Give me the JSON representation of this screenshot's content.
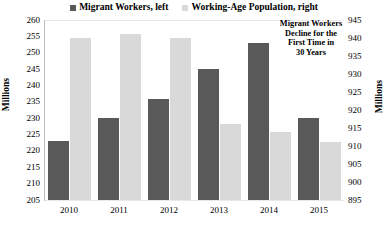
{
  "legend": {
    "items": [
      {
        "label": "Migrant Workers, left",
        "color": "#595959",
        "icon": "square-swatch-icon"
      },
      {
        "label": "Working-Age Population, right",
        "color": "#d9d9d9",
        "icon": "square-swatch-icon"
      }
    ]
  },
  "axes": {
    "left_title": "Millions",
    "right_title": "Millions",
    "left_ticks": [
      "260",
      "255",
      "250",
      "245",
      "240",
      "235",
      "230",
      "225",
      "220",
      "215",
      "210",
      "205"
    ],
    "right_ticks": [
      "945",
      "940",
      "935",
      "930",
      "925",
      "920",
      "915",
      "910",
      "905",
      "900",
      "895"
    ]
  },
  "annotation": {
    "line1": "Migrant Workers",
    "line2": "Decline for the",
    "line3": "First Time in",
    "line4": "30 Years"
  },
  "xlabels": [
    "2010",
    "2011",
    "2012",
    "2013",
    "2014",
    "2015"
  ],
  "chart_data": {
    "type": "bar",
    "title": "",
    "subtitle": "",
    "xlabel": "",
    "ylabel": "Millions",
    "y2label": "Millions",
    "categories": [
      "2010",
      "2011",
      "2012",
      "2013",
      "2014",
      "2015"
    ],
    "grid": true,
    "legend_position": "top-center",
    "ylim": [
      205,
      260
    ],
    "y2lim": [
      895,
      945
    ],
    "ytick_step": 5,
    "y2tick_step": 5,
    "series": [
      {
        "name": "Migrant Workers, left",
        "axis": "left",
        "color": "#595959",
        "values": [
          223,
          230,
          236,
          245,
          253,
          230
        ]
      },
      {
        "name": "Working-Age Population, right",
        "axis": "right",
        "color": "#d9d9d9",
        "values": [
          940,
          941,
          940,
          916,
          914,
          911
        ]
      }
    ],
    "annotations": [
      {
        "text": "Migrant Workers Decline for the First Time in 30 Years",
        "target_category": "2015",
        "target_series": "Migrant Workers, left"
      }
    ]
  }
}
